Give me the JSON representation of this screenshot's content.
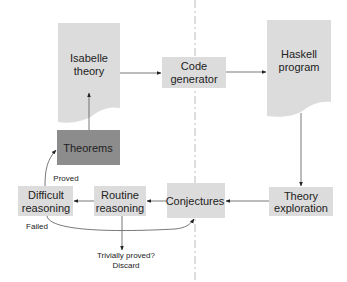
{
  "colors": {
    "box_fill": "#dcdcdc",
    "theorems_fill": "#8c8c8c",
    "edge": "#555555",
    "text": "#222222",
    "divider": "#aaaaaa"
  },
  "nodes": {
    "isabelle_theory": {
      "lines": [
        "Isabelle",
        "theory"
      ],
      "shape": "document"
    },
    "code_generator": {
      "lines": [
        "Code",
        "generator"
      ],
      "shape": "box"
    },
    "haskell_program": {
      "lines": [
        "Haskell",
        "program"
      ],
      "shape": "document"
    },
    "theorems": {
      "lines": [
        "Theorems"
      ],
      "shape": "box-dark"
    },
    "difficult_reasoning": {
      "lines": [
        "Difficult",
        "reasoning"
      ],
      "shape": "box"
    },
    "routine_reasoning": {
      "lines": [
        "Routine",
        "reasoning"
      ],
      "shape": "box"
    },
    "conjectures": {
      "lines": [
        "Conjectures"
      ],
      "shape": "box"
    },
    "theory_exploration": {
      "lines": [
        "Theory",
        "exploration"
      ],
      "shape": "box"
    }
  },
  "edges": [
    {
      "from": "isabelle_theory",
      "to": "code_generator",
      "label": ""
    },
    {
      "from": "code_generator",
      "to": "haskell_program",
      "label": ""
    },
    {
      "from": "haskell_program",
      "to": "theory_exploration",
      "label": ""
    },
    {
      "from": "theory_exploration",
      "to": "conjectures",
      "label": ""
    },
    {
      "from": "conjectures",
      "to": "routine_reasoning",
      "label": ""
    },
    {
      "from": "routine_reasoning",
      "to": "difficult_reasoning",
      "label": ""
    },
    {
      "from": "routine_reasoning",
      "to": "discard",
      "label": ""
    },
    {
      "from": "difficult_reasoning",
      "to": "theorems",
      "label": "Proved"
    },
    {
      "from": "difficult_reasoning",
      "to": "conjectures",
      "label": "Failed"
    },
    {
      "from": "theorems",
      "to": "isabelle_theory",
      "label": ""
    }
  ],
  "labels": {
    "proved": "Proved",
    "failed": "Failed",
    "trivially_proved": [
      "Trivially proved?",
      "Discard"
    ]
  }
}
